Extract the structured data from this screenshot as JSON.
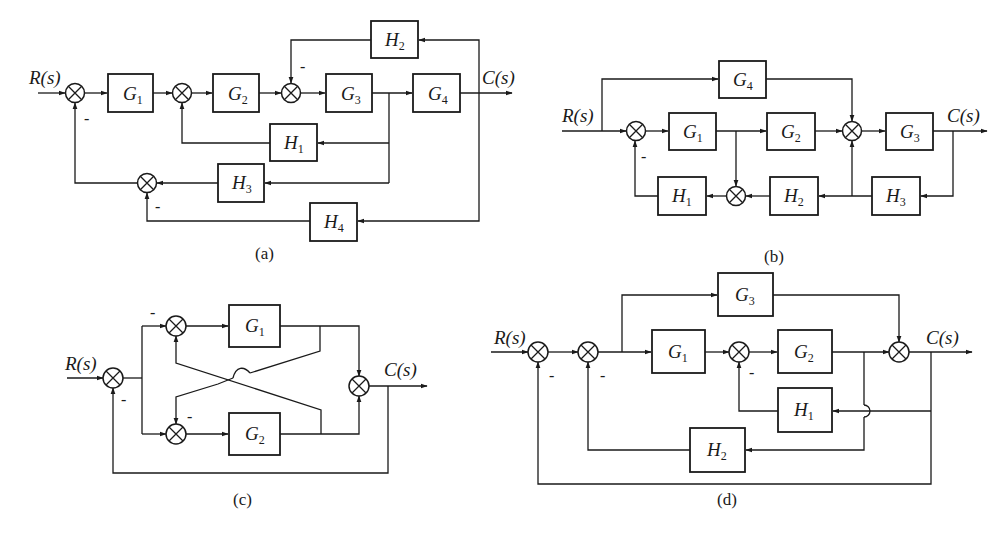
{
  "figure": {
    "type": "control-system block diagrams",
    "panel_count": 4,
    "colors": {
      "ink": "#1a1a1a",
      "background": "#ffffff"
    }
  },
  "panels": {
    "a": {
      "caption": "(a)",
      "input_label": "R(s)",
      "output_label": "C(s)",
      "blocks": [
        {
          "id": "G1",
          "base": "G",
          "sub": "1",
          "x": 108,
          "y": 74,
          "w": 45,
          "h": 38
        },
        {
          "id": "G2",
          "base": "G",
          "sub": "2",
          "x": 213,
          "y": 74,
          "w": 46,
          "h": 38
        },
        {
          "id": "G3",
          "base": "G",
          "sub": "3",
          "x": 326,
          "y": 74,
          "w": 46,
          "h": 38
        },
        {
          "id": "G4",
          "base": "G",
          "sub": "4",
          "x": 413,
          "y": 74,
          "w": 47,
          "h": 38
        },
        {
          "id": "H1",
          "base": "H",
          "sub": "1",
          "x": 270,
          "y": 124,
          "w": 47,
          "h": 37
        },
        {
          "id": "H2",
          "base": "H",
          "sub": "2",
          "x": 371,
          "y": 21,
          "w": 47,
          "h": 37
        },
        {
          "id": "H3",
          "base": "H",
          "sub": "3",
          "x": 218,
          "y": 164,
          "w": 46,
          "h": 38
        },
        {
          "id": "H4",
          "base": "H",
          "sub": "4",
          "x": 310,
          "y": 203,
          "w": 47,
          "h": 38
        }
      ],
      "summers": [
        {
          "id": "S1",
          "cx": 75,
          "cy": 93,
          "minus": "bottom"
        },
        {
          "id": "S2",
          "cx": 182,
          "cy": 93,
          "minus": ""
        },
        {
          "id": "S3",
          "cx": 291,
          "cy": 93,
          "minus": "top"
        },
        {
          "id": "S4",
          "cx": 147,
          "cy": 183,
          "minus": "bottom"
        }
      ],
      "minus_signs": [
        "-",
        "-",
        "-"
      ]
    },
    "b": {
      "caption": "(b)",
      "input_label": "R(s)",
      "output_label": "C(s)",
      "blocks": [
        {
          "id": "G1",
          "base": "G",
          "sub": "1",
          "x": 669,
          "y": 113,
          "w": 47,
          "h": 37
        },
        {
          "id": "G2",
          "base": "G",
          "sub": "2",
          "x": 767,
          "y": 113,
          "w": 48,
          "h": 37
        },
        {
          "id": "G3",
          "base": "G",
          "sub": "3",
          "x": 886,
          "y": 113,
          "w": 47,
          "h": 37
        },
        {
          "id": "G4",
          "base": "G",
          "sub": "4",
          "x": 719,
          "y": 61,
          "w": 47,
          "h": 37
        },
        {
          "id": "H1",
          "base": "H",
          "sub": "1",
          "x": 658,
          "y": 177,
          "w": 48,
          "h": 38
        },
        {
          "id": "H2",
          "base": "H",
          "sub": "2",
          "x": 770,
          "y": 177,
          "w": 48,
          "h": 38
        },
        {
          "id": "H3",
          "base": "H",
          "sub": "3",
          "x": 872,
          "y": 177,
          "w": 48,
          "h": 38
        }
      ],
      "summers": [
        {
          "id": "S1",
          "cx": 636,
          "cy": 131,
          "minus": "bottom"
        },
        {
          "id": "S2",
          "cx": 852,
          "cy": 131,
          "minus": ""
        },
        {
          "id": "S3",
          "cx": 736,
          "cy": 196,
          "minus": ""
        }
      ],
      "minus_signs": [
        "-"
      ]
    },
    "c": {
      "caption": "(c)",
      "input_label": "R(s)",
      "output_label": "C(s)",
      "blocks": [
        {
          "id": "G1",
          "base": "G",
          "sub": "1",
          "x": 229,
          "y": 305,
          "w": 51,
          "h": 42
        },
        {
          "id": "G2",
          "base": "G",
          "sub": "2",
          "x": 229,
          "y": 413,
          "w": 51,
          "h": 42
        }
      ],
      "summers": [
        {
          "id": "S1",
          "cx": 113,
          "cy": 378,
          "minus": "bottom"
        },
        {
          "id": "S2",
          "cx": 176,
          "cy": 326,
          "minus": "left"
        },
        {
          "id": "S3",
          "cx": 176,
          "cy": 434,
          "minus": "top"
        },
        {
          "id": "S4",
          "cx": 359,
          "cy": 386,
          "minus": ""
        }
      ],
      "minus_signs": [
        "-",
        "-",
        "-"
      ]
    },
    "d": {
      "caption": "(d)",
      "input_label": "R(s)",
      "output_label": "C(s)",
      "blocks": [
        {
          "id": "G1",
          "base": "G",
          "sub": "1",
          "x": 652,
          "y": 330,
          "w": 53,
          "h": 43
        },
        {
          "id": "G2",
          "base": "G",
          "sub": "2",
          "x": 778,
          "y": 330,
          "w": 54,
          "h": 43
        },
        {
          "id": "G3",
          "base": "G",
          "sub": "3",
          "x": 718,
          "y": 273,
          "w": 55,
          "h": 43
        },
        {
          "id": "H1",
          "base": "H",
          "sub": "1",
          "x": 778,
          "y": 388,
          "w": 54,
          "h": 44
        },
        {
          "id": "H2",
          "base": "H",
          "sub": "2",
          "x": 690,
          "y": 428,
          "w": 55,
          "h": 44
        }
      ],
      "summers": [
        {
          "id": "S1",
          "cx": 538,
          "cy": 352,
          "minus": "bottom"
        },
        {
          "id": "S2",
          "cx": 588,
          "cy": 352,
          "minus": "bottom"
        },
        {
          "id": "S3",
          "cx": 739,
          "cy": 352,
          "minus": "bottom"
        },
        {
          "id": "S4",
          "cx": 899,
          "cy": 352,
          "minus": ""
        }
      ],
      "minus_signs": [
        "-",
        "-",
        "-"
      ]
    }
  }
}
